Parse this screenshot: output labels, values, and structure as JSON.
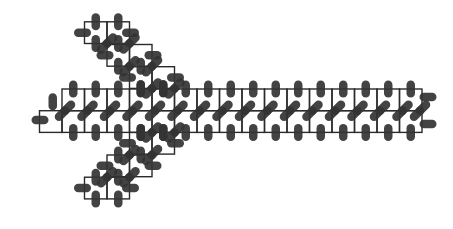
{
  "diagram": {
    "title": "",
    "colors": {
      "background": "#ffffff",
      "grid_line": "#2a2a2a",
      "particle": "#333333"
    },
    "cell": {
      "w": 22.5,
      "h": 21.7
    },
    "main_band": {
      "x0": 62,
      "y_top": 89,
      "rows": 2,
      "cols": 16,
      "extra_left_cell": {
        "x": 39.5,
        "row": 1
      }
    },
    "upper_branch": [
      {
        "x": 84.5,
        "y": 21.8,
        "cols": 2
      },
      {
        "x": 107,
        "y": 44.5,
        "cols": 2
      },
      {
        "x": 129.5,
        "y": 66.7,
        "cols": 2
      }
    ],
    "lower_branch": [
      {
        "x": 129.5,
        "y": 132.4,
        "cols": 2
      },
      {
        "x": 107,
        "y": 155,
        "cols": 2
      },
      {
        "x": 84.5,
        "y": 177.2,
        "cols": 2
      }
    ],
    "end_caps": {
      "left": [
        {
          "cx": 40,
          "cy": 120,
          "rot": 0
        }
      ],
      "right": [
        {
          "cx": 428,
          "cy": 97,
          "rot": 0
        },
        {
          "cx": 428,
          "cy": 124,
          "rot": 0
        }
      ]
    },
    "pill": {
      "length": 17,
      "width": 8.5
    }
  }
}
